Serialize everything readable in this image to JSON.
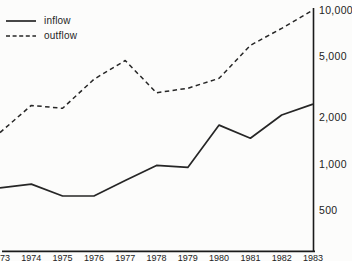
{
  "legend": {
    "items": [
      {
        "label": "inflow",
        "style": "solid"
      },
      {
        "label": "outflow",
        "style": "dashed"
      }
    ]
  },
  "chart_data": {
    "type": "line",
    "x": [
      1973,
      1974,
      1975,
      1976,
      1977,
      1978,
      1979,
      1980,
      1981,
      1982,
      1983
    ],
    "x_tick_labels": [
      "1973",
      "1974",
      "1975",
      "1976",
      "1977",
      "1978",
      "1979",
      "1980",
      "1981",
      "1982",
      "1983"
    ],
    "series": [
      {
        "name": "inflow",
        "style": "solid",
        "values": [
          700,
          740,
          620,
          620,
          780,
          980,
          950,
          1790,
          1470,
          2080,
          2450
        ]
      },
      {
        "name": "outflow",
        "style": "dashed",
        "values": [
          1600,
          2400,
          2300,
          3550,
          4700,
          2900,
          3100,
          3600,
          5900,
          7600,
          10000
        ]
      }
    ],
    "title": "",
    "xlabel": "",
    "ylabel": "",
    "y_scale": "log",
    "y_ticks": [
      10000,
      5000,
      2000,
      1000,
      500
    ],
    "y_tick_labels": [
      "10,000",
      "5,000",
      "2,000",
      "1,000",
      "500"
    ],
    "ylim": [
      270,
      10000
    ],
    "grid": false,
    "legend_position": "top-left",
    "y_axis_side": "right"
  },
  "colors": {
    "line": "#262626",
    "axis": "#1a1a1a",
    "text": "#222222",
    "background": "#fcfcfb"
  }
}
